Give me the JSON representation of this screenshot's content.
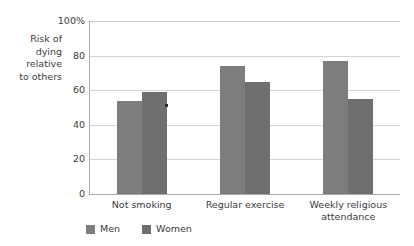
{
  "chart_data": {
    "type": "bar",
    "title": "",
    "subtitle": "",
    "xlabel": "",
    "ylabel": "Risk of\ndying\nrelative\nto others",
    "categories": [
      "Not smoking",
      "Regular exercise",
      "Weekly religious\nattendance"
    ],
    "series": [
      {
        "name": "Men",
        "values": [
          54,
          74,
          77
        ],
        "color": "#7d7d7d"
      },
      {
        "name": "Women",
        "values": [
          59,
          65,
          55
        ],
        "color": "#6f6f6f"
      }
    ],
    "ylim": [
      0,
      100
    ],
    "yticks": [
      0,
      20,
      40,
      60,
      80,
      100
    ],
    "ytick_labels": [
      "0",
      "20",
      "40",
      "60",
      "80",
      "100%"
    ],
    "grid": true,
    "legend_position": "bottom-left",
    "axis_color": "#a8a8a8",
    "grid_color": "#d4d4d4",
    "text_color": "#3b3b3b",
    "background": "#ffffff"
  },
  "legend": {
    "items": [
      {
        "label": "Men"
      },
      {
        "label": "Women"
      }
    ]
  }
}
